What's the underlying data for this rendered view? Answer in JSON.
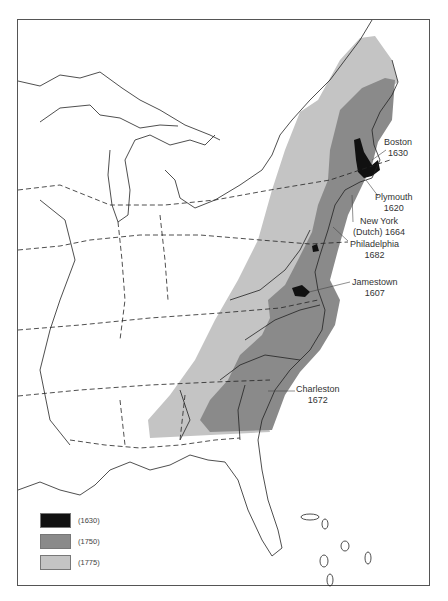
{
  "map": {
    "title": "",
    "description": "Growth of English colonial settlement in eastern North America",
    "colors": {
      "s1630": "#111111",
      "s1750": "#8a8a8a",
      "s1775": "#c4c4c4",
      "outline": "#222222",
      "background": "#ffffff"
    },
    "settlements": [
      {
        "name": "Boston",
        "year": "1630"
      },
      {
        "name": "Plymouth",
        "year": "1620"
      },
      {
        "name": "New York",
        "qualifier": "(Dutch)",
        "year": "1664"
      },
      {
        "name": "Philadelphia",
        "year": "1682"
      },
      {
        "name": "Jamestown",
        "year": "1607"
      },
      {
        "name": "Charleston",
        "year": "1672"
      }
    ],
    "legend": [
      {
        "label": "(1630)",
        "color": "#111111"
      },
      {
        "label": "(1750)",
        "color": "#8a8a8a"
      },
      {
        "label": "(1775)",
        "color": "#c4c4c4"
      }
    ]
  }
}
